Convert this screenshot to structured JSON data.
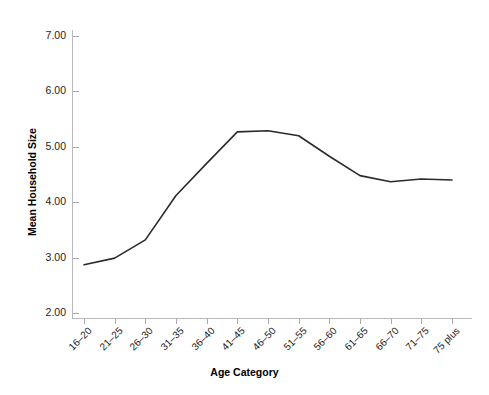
{
  "page_header": {
    "folio": "",
    "running_title": ""
  },
  "chart_data": {
    "type": "line",
    "title": "",
    "xlabel": "Age Category",
    "ylabel": "Mean Household Size",
    "categories": [
      "16–20",
      "21–25",
      "26–30",
      "31–35",
      "36–40",
      "41–45",
      "46–50",
      "51–55",
      "56–60",
      "61–65",
      "66–70",
      "71–75",
      "75 plus"
    ],
    "values": [
      2.87,
      2.99,
      3.32,
      4.12,
      4.7,
      5.27,
      5.29,
      5.2,
      4.83,
      4.48,
      4.37,
      4.42,
      4.4
    ],
    "ylim": [
      2.0,
      7.0
    ],
    "ytick_labels": [
      "7.00",
      "6.00",
      "5.00",
      "4.00",
      "3.00",
      "2.00"
    ],
    "ytick_values": [
      7.0,
      6.0,
      5.0,
      4.0,
      3.0,
      2.0
    ],
    "grid": false,
    "legend": false,
    "line_color": "#2b2b2b",
    "line_width": 1.6,
    "markers": false,
    "axis_color": "#b9b9bd",
    "background": "#ffffff"
  }
}
